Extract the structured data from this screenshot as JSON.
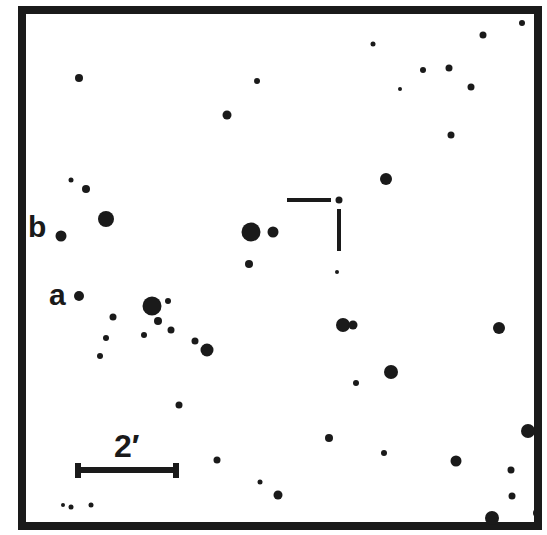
{
  "chart": {
    "title": "",
    "frame_color": "#1a1a1a",
    "background": "#ffffff"
  },
  "labels": {
    "a": "a",
    "b": "b",
    "scale": "2′"
  },
  "scale_bar": {
    "x1": 75,
    "x2": 179,
    "y": 470,
    "length_arcmin": 2
  },
  "target_marker": {
    "horizontal": {
      "x1": 287,
      "x2": 331,
      "y": 200
    },
    "vertical": {
      "x": 339,
      "y1": 209,
      "y2": 251
    }
  },
  "chart_data": {
    "type": "scatter",
    "title": "",
    "xlabel": "",
    "ylabel": "",
    "grid": false,
    "legend": [],
    "annotations": [
      "a",
      "b",
      "2′ scale bar",
      "target tick marks"
    ],
    "points": [
      {
        "x": 79,
        "y": 78,
        "r": 4
      },
      {
        "x": 257,
        "y": 81,
        "r": 3
      },
      {
        "x": 227,
        "y": 115,
        "r": 4.5
      },
      {
        "x": 373,
        "y": 44,
        "r": 2.5
      },
      {
        "x": 483,
        "y": 35,
        "r": 3.5
      },
      {
        "x": 522,
        "y": 23,
        "r": 3
      },
      {
        "x": 423,
        "y": 70,
        "r": 3
      },
      {
        "x": 449,
        "y": 68,
        "r": 3.5
      },
      {
        "x": 400,
        "y": 89,
        "r": 2
      },
      {
        "x": 471,
        "y": 87,
        "r": 3.5
      },
      {
        "x": 451,
        "y": 135,
        "r": 3.5
      },
      {
        "x": 386,
        "y": 179,
        "r": 6
      },
      {
        "x": 71,
        "y": 180,
        "r": 2.5
      },
      {
        "x": 86,
        "y": 189,
        "r": 4
      },
      {
        "x": 106,
        "y": 219,
        "r": 8
      },
      {
        "x": 61,
        "y": 236,
        "r": 5.5,
        "label": "b"
      },
      {
        "x": 251,
        "y": 232,
        "r": 9.5
      },
      {
        "x": 273,
        "y": 232,
        "r": 5.5
      },
      {
        "x": 249,
        "y": 264,
        "r": 4
      },
      {
        "x": 339,
        "y": 200,
        "r": 3.5,
        "note": "target"
      },
      {
        "x": 337,
        "y": 272,
        "r": 2
      },
      {
        "x": 79,
        "y": 296,
        "r": 5,
        "label": "a"
      },
      {
        "x": 152,
        "y": 306,
        "r": 9.5
      },
      {
        "x": 168,
        "y": 301,
        "r": 3
      },
      {
        "x": 158,
        "y": 321,
        "r": 4
      },
      {
        "x": 171,
        "y": 330,
        "r": 3.5
      },
      {
        "x": 113,
        "y": 317,
        "r": 3.5
      },
      {
        "x": 106,
        "y": 338,
        "r": 3
      },
      {
        "x": 144,
        "y": 335,
        "r": 3
      },
      {
        "x": 100,
        "y": 356,
        "r": 3
      },
      {
        "x": 195,
        "y": 341,
        "r": 3.5
      },
      {
        "x": 207,
        "y": 350,
        "r": 6.5
      },
      {
        "x": 179,
        "y": 405,
        "r": 3.5
      },
      {
        "x": 343,
        "y": 325,
        "r": 7
      },
      {
        "x": 353,
        "y": 325,
        "r": 4.5
      },
      {
        "x": 499,
        "y": 328,
        "r": 6
      },
      {
        "x": 391,
        "y": 372,
        "r": 7
      },
      {
        "x": 356,
        "y": 383,
        "r": 3
      },
      {
        "x": 329,
        "y": 438,
        "r": 4
      },
      {
        "x": 384,
        "y": 453,
        "r": 3
      },
      {
        "x": 456,
        "y": 461,
        "r": 5.5
      },
      {
        "x": 528,
        "y": 431,
        "r": 7
      },
      {
        "x": 511,
        "y": 470,
        "r": 3.5
      },
      {
        "x": 512,
        "y": 496,
        "r": 3.5
      },
      {
        "x": 217,
        "y": 460,
        "r": 3.5
      },
      {
        "x": 260,
        "y": 482,
        "r": 2.5
      },
      {
        "x": 278,
        "y": 495,
        "r": 4.5
      },
      {
        "x": 492,
        "y": 518,
        "r": 7
      },
      {
        "x": 537,
        "y": 513,
        "r": 4
      },
      {
        "x": 63,
        "y": 505,
        "r": 2
      },
      {
        "x": 71,
        "y": 507,
        "r": 2.5
      },
      {
        "x": 91,
        "y": 505,
        "r": 2.5
      }
    ]
  }
}
